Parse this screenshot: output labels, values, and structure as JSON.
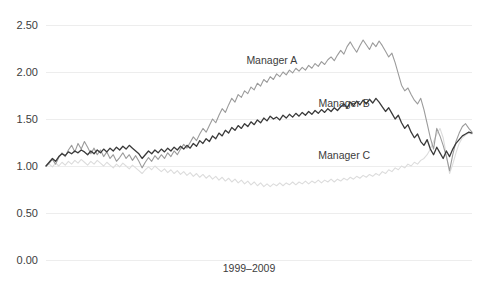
{
  "chart_data": {
    "type": "line",
    "title": "",
    "subtitle": "",
    "xlabel": "1999–2009",
    "ylabel": "",
    "ylim": [
      0.0,
      2.5
    ],
    "ytick_labels": [
      "2.50",
      "2.00",
      "1.50",
      "1.00",
      "0.50",
      "0.00"
    ],
    "ytick_values": [
      2.5,
      2.0,
      1.5,
      1.0,
      0.5,
      0.0
    ],
    "xlim": [
      0,
      132
    ],
    "xtick_labels": [],
    "grid": "horizontal",
    "legend": "inline-annotations",
    "annotations": [
      {
        "text": "Manager A",
        "x": 0.53,
        "y": 2.08
      },
      {
        "text": "Manager B",
        "x": 0.7,
        "y": 1.63
      },
      {
        "text": "Manager C",
        "x": 0.7,
        "y": 1.07
      }
    ],
    "series": [
      {
        "name": "Manager A",
        "color": "#9b9b9b",
        "width": 1.1,
        "values": [
          1.0,
          1.03,
          1.07,
          1.02,
          1.09,
          1.14,
          1.1,
          1.17,
          1.22,
          1.15,
          1.24,
          1.18,
          1.26,
          1.2,
          1.13,
          1.19,
          1.12,
          1.17,
          1.1,
          1.15,
          1.08,
          1.12,
          1.05,
          1.09,
          1.14,
          1.08,
          1.12,
          1.06,
          1.11,
          1.05,
          0.98,
          1.04,
          1.09,
          1.05,
          1.11,
          1.07,
          1.12,
          1.08,
          1.14,
          1.1,
          1.16,
          1.12,
          1.18,
          1.23,
          1.19,
          1.25,
          1.31,
          1.27,
          1.34,
          1.4,
          1.36,
          1.43,
          1.5,
          1.46,
          1.54,
          1.61,
          1.57,
          1.65,
          1.72,
          1.68,
          1.76,
          1.73,
          1.8,
          1.77,
          1.84,
          1.81,
          1.88,
          1.85,
          1.92,
          1.89,
          1.95,
          1.92,
          1.98,
          1.95,
          2.0,
          1.97,
          2.02,
          1.99,
          2.04,
          2.01,
          2.05,
          2.02,
          2.07,
          2.04,
          2.09,
          2.06,
          2.11,
          2.08,
          2.13,
          2.16,
          2.12,
          2.18,
          2.23,
          2.19,
          2.27,
          2.32,
          2.26,
          2.21,
          2.28,
          2.34,
          2.29,
          2.24,
          2.31,
          2.27,
          2.33,
          2.28,
          2.22,
          2.16,
          2.2,
          2.1,
          1.98,
          1.86,
          1.8,
          1.83,
          1.76,
          1.7,
          1.66,
          1.72,
          1.6,
          1.45,
          1.3,
          1.18,
          1.4,
          1.32,
          1.22,
          1.1,
          0.95,
          1.12,
          1.26,
          1.35,
          1.42,
          1.45,
          1.4,
          1.36
        ]
      },
      {
        "name": "Manager B",
        "color": "#3a3a3a",
        "width": 1.3,
        "values": [
          1.0,
          1.04,
          1.08,
          1.05,
          1.1,
          1.13,
          1.11,
          1.15,
          1.13,
          1.16,
          1.14,
          1.17,
          1.15,
          1.12,
          1.16,
          1.13,
          1.17,
          1.14,
          1.18,
          1.15,
          1.19,
          1.16,
          1.2,
          1.17,
          1.21,
          1.18,
          1.22,
          1.19,
          1.16,
          1.13,
          1.08,
          1.12,
          1.16,
          1.13,
          1.17,
          1.14,
          1.18,
          1.15,
          1.19,
          1.16,
          1.2,
          1.17,
          1.21,
          1.18,
          1.22,
          1.19,
          1.24,
          1.21,
          1.27,
          1.24,
          1.29,
          1.26,
          1.32,
          1.29,
          1.35,
          1.32,
          1.38,
          1.35,
          1.41,
          1.38,
          1.43,
          1.4,
          1.45,
          1.42,
          1.47,
          1.44,
          1.49,
          1.46,
          1.51,
          1.48,
          1.53,
          1.5,
          1.52,
          1.49,
          1.54,
          1.51,
          1.55,
          1.52,
          1.56,
          1.53,
          1.57,
          1.54,
          1.58,
          1.55,
          1.59,
          1.56,
          1.6,
          1.57,
          1.61,
          1.58,
          1.62,
          1.59,
          1.63,
          1.66,
          1.62,
          1.68,
          1.64,
          1.69,
          1.65,
          1.7,
          1.66,
          1.71,
          1.67,
          1.72,
          1.68,
          1.63,
          1.58,
          1.62,
          1.56,
          1.5,
          1.54,
          1.46,
          1.4,
          1.44,
          1.36,
          1.3,
          1.34,
          1.26,
          1.22,
          1.28,
          1.18,
          1.12,
          1.2,
          1.14,
          1.08,
          1.16,
          1.1,
          1.18,
          1.24,
          1.28,
          1.32,
          1.34,
          1.36,
          1.35
        ]
      },
      {
        "name": "Manager C",
        "color": "#dcdcdc",
        "width": 1.1,
        "values": [
          1.0,
          1.02,
          0.99,
          1.03,
          1.0,
          1.04,
          1.01,
          1.05,
          1.02,
          1.06,
          1.03,
          1.07,
          1.04,
          1.01,
          1.05,
          1.02,
          1.06,
          1.03,
          1.0,
          1.04,
          1.01,
          0.98,
          1.02,
          0.99,
          1.03,
          1.0,
          0.97,
          1.01,
          0.98,
          0.95,
          0.92,
          0.96,
          0.99,
          0.96,
          1.0,
          0.97,
          0.94,
          0.97,
          0.93,
          0.96,
          0.92,
          0.95,
          0.91,
          0.94,
          0.9,
          0.93,
          0.89,
          0.92,
          0.88,
          0.91,
          0.87,
          0.9,
          0.86,
          0.89,
          0.85,
          0.88,
          0.84,
          0.87,
          0.83,
          0.86,
          0.82,
          0.85,
          0.81,
          0.84,
          0.8,
          0.83,
          0.79,
          0.82,
          0.78,
          0.81,
          0.78,
          0.81,
          0.79,
          0.82,
          0.79,
          0.82,
          0.8,
          0.83,
          0.8,
          0.83,
          0.81,
          0.84,
          0.81,
          0.84,
          0.82,
          0.85,
          0.82,
          0.85,
          0.83,
          0.86,
          0.83,
          0.86,
          0.84,
          0.87,
          0.85,
          0.88,
          0.86,
          0.89,
          0.87,
          0.9,
          0.88,
          0.91,
          0.89,
          0.92,
          0.9,
          0.94,
          0.92,
          0.96,
          0.94,
          0.98,
          0.96,
          1.0,
          0.98,
          1.02,
          1.0,
          1.04,
          1.02,
          1.06,
          1.08,
          1.12,
          1.18,
          1.26,
          1.34,
          1.4,
          1.3,
          1.12,
          0.92,
          1.02,
          1.14,
          1.24,
          1.3,
          1.33,
          1.35,
          1.34
        ]
      }
    ]
  },
  "axis": {
    "y_labels": [
      "2.50",
      "2.00",
      "1.50",
      "1.00",
      "0.50",
      "0.00"
    ],
    "x_title": "1999–2009"
  },
  "labels": {
    "manager_a": "Manager A",
    "manager_b": "Manager B",
    "manager_c": "Manager C"
  },
  "colors": {
    "series_a": "#9b9b9b",
    "series_b": "#3a3a3a",
    "series_c": "#dcdcdc",
    "gridline": "#e8e8e8",
    "text": "#3c3c3c",
    "background": "#ffffff"
  }
}
